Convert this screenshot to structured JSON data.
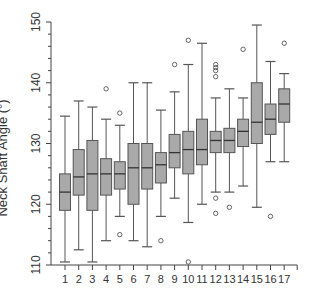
{
  "chart_data": {
    "type": "box",
    "title": "",
    "xlabel": "",
    "ylabel": "Neck Shaft Angle (°)",
    "ylim": [
      110,
      150
    ],
    "yticks": [
      110,
      120,
      130,
      140,
      150
    ],
    "categories": [
      "1",
      "2",
      "3",
      "4",
      "5",
      "6",
      "7",
      "8",
      "9",
      "10",
      "11",
      "12",
      "13",
      "14",
      "15",
      "16",
      "17"
    ],
    "grid": false,
    "box_color": "#a9a9a9",
    "line_color": "#555555",
    "series": [
      {
        "cat": "1",
        "whisker_low": 110.5,
        "q1": 119,
        "median": 122,
        "q3": 125,
        "whisker_high": 134.5,
        "outliers": []
      },
      {
        "cat": "2",
        "whisker_low": 112.5,
        "q1": 121.5,
        "median": 124.5,
        "q3": 129,
        "whisker_high": 137,
        "outliers": []
      },
      {
        "cat": "3",
        "whisker_low": 110.5,
        "q1": 119,
        "median": 125,
        "q3": 130.5,
        "whisker_high": 136,
        "outliers": []
      },
      {
        "cat": "4",
        "whisker_low": 114,
        "q1": 121.5,
        "median": 125,
        "q3": 127.5,
        "whisker_high": 134,
        "outliers": [
          139
        ]
      },
      {
        "cat": "5",
        "whisker_low": 118,
        "q1": 122.5,
        "median": 125,
        "q3": 127,
        "whisker_high": 133,
        "outliers": [
          135,
          115
        ]
      },
      {
        "cat": "6",
        "whisker_low": 114,
        "q1": 120,
        "median": 126,
        "q3": 130,
        "whisker_high": 140,
        "outliers": []
      },
      {
        "cat": "7",
        "whisker_low": 113,
        "q1": 122.5,
        "median": 126,
        "q3": 130,
        "whisker_high": 140,
        "outliers": []
      },
      {
        "cat": "8",
        "whisker_low": 118,
        "q1": 123.5,
        "median": 126.5,
        "q3": 128.5,
        "whisker_high": 135.5,
        "outliers": [
          114
        ]
      },
      {
        "cat": "9",
        "whisker_low": 121,
        "q1": 126,
        "median": 128.5,
        "q3": 131.5,
        "whisker_high": 138.5,
        "outliers": [
          143
        ]
      },
      {
        "cat": "10",
        "whisker_low": 117,
        "q1": 125,
        "median": 129,
        "q3": 132,
        "whisker_high": 143,
        "outliers": [
          147,
          110.5
        ]
      },
      {
        "cat": "11",
        "whisker_low": 120,
        "q1": 126.5,
        "median": 129,
        "q3": 134,
        "whisker_high": 146.5,
        "outliers": []
      },
      {
        "cat": "12",
        "whisker_low": 122,
        "q1": 128.5,
        "median": 130.5,
        "q3": 132,
        "whisker_high": 137.5,
        "outliers": [
          143,
          142.5,
          142,
          141,
          121,
          118.5
        ]
      },
      {
        "cat": "13",
        "whisker_low": 122,
        "q1": 128.5,
        "median": 130.5,
        "q3": 132.5,
        "whisker_high": 139,
        "outliers": [
          119.5
        ]
      },
      {
        "cat": "14",
        "whisker_low": 123,
        "q1": 129.5,
        "median": 132,
        "q3": 134,
        "whisker_high": 137.5,
        "outliers": [
          145.5
        ]
      },
      {
        "cat": "15",
        "whisker_low": 119.5,
        "q1": 130,
        "median": 133.5,
        "q3": 140,
        "whisker_high": 149.5,
        "outliers": []
      },
      {
        "cat": "16",
        "whisker_low": 127,
        "q1": 131.5,
        "median": 134,
        "q3": 136.5,
        "whisker_high": 143.5,
        "outliers": [
          118
        ]
      },
      {
        "cat": "17",
        "whisker_low": 127,
        "q1": 133.5,
        "median": 136.5,
        "q3": 139,
        "whisker_high": 141.5,
        "outliers": [
          146.5
        ]
      }
    ]
  }
}
